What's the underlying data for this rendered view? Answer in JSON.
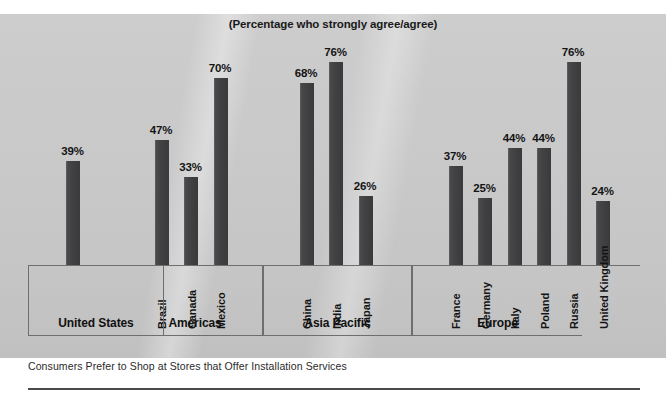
{
  "chart_data": {
    "type": "bar",
    "title": "(Percentage who strongly agree/agree)",
    "caption": "Consumers Prefer to Shop at Stores that Offer Installation Services",
    "xlabel": "",
    "ylabel": "",
    "ylim": [
      0,
      80
    ],
    "grid": false,
    "legend": "none",
    "value_suffix": "%",
    "bar_color": "#414144",
    "background_color": "#c8c8c8",
    "categories": [
      "United States",
      "Brazil",
      "Canada",
      "Mexico",
      "China",
      "India",
      "Japan",
      "France",
      "Germany",
      "Italy",
      "Poland",
      "Russia",
      "United Kingdom"
    ],
    "values": [
      39,
      47,
      33,
      70,
      68,
      76,
      26,
      37,
      25,
      44,
      44,
      76,
      24
    ],
    "bars": [
      {
        "label": "United States",
        "value": 39,
        "value_text": "39%",
        "group": "United States",
        "label_orientation": "horizontal"
      },
      {
        "label": "Brazil",
        "value": 47,
        "value_text": "47%",
        "group": "Americas",
        "label_orientation": "vertical"
      },
      {
        "label": "Canada",
        "value": 33,
        "value_text": "33%",
        "group": "Americas",
        "label_orientation": "vertical"
      },
      {
        "label": "Mexico",
        "value": 70,
        "value_text": "70%",
        "group": "Americas",
        "label_orientation": "vertical"
      },
      {
        "label": "China",
        "value": 68,
        "value_text": "68%",
        "group": "Asia Pacific",
        "label_orientation": "vertical"
      },
      {
        "label": "India",
        "value": 76,
        "value_text": "76%",
        "group": "Asia Pacific",
        "label_orientation": "vertical"
      },
      {
        "label": "Japan",
        "value": 26,
        "value_text": "26%",
        "group": "Asia Pacific",
        "label_orientation": "vertical"
      },
      {
        "label": "France",
        "value": 37,
        "value_text": "37%",
        "group": "Europe",
        "label_orientation": "vertical"
      },
      {
        "label": "Germany",
        "value": 25,
        "value_text": "25%",
        "group": "Europe",
        "label_orientation": "vertical"
      },
      {
        "label": "Italy",
        "value": 44,
        "value_text": "44%",
        "group": "Europe",
        "label_orientation": "vertical"
      },
      {
        "label": "Poland",
        "value": 44,
        "value_text": "44%",
        "group": "Europe",
        "label_orientation": "vertical"
      },
      {
        "label": "Russia",
        "value": 76,
        "value_text": "76%",
        "group": "Europe",
        "label_orientation": "vertical"
      },
      {
        "label": "United Kingdom",
        "value": 24,
        "value_text": "24%",
        "group": "",
        "label_orientation": "vertical"
      }
    ],
    "groups": [
      {
        "name": "United States",
        "label": "United States"
      },
      {
        "name": "Americas",
        "label": "Americas"
      },
      {
        "name": "Asia Pacific",
        "label": "Asia Pacific"
      },
      {
        "name": "Europe",
        "label": "Europe"
      }
    ]
  }
}
